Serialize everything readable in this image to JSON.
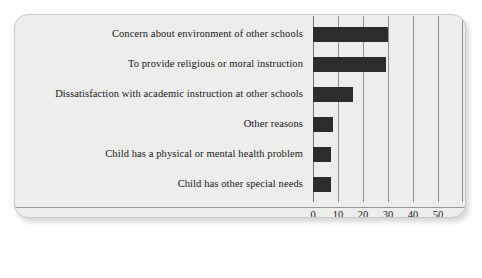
{
  "chart_data": {
    "type": "bar",
    "orientation": "horizontal",
    "title": "",
    "xlabel": "Percentage",
    "ylabel": "",
    "xlim": [
      0,
      55
    ],
    "xticks": [
      0,
      10,
      20,
      30,
      40,
      50
    ],
    "grid": true,
    "legend": false,
    "bar_color": "#2c2c2c",
    "categories": [
      "Concern about environment of other schools",
      "To provide religious or moral instruction",
      "Dissatisfaction with academic instruction at other schools",
      "Other reasons",
      "Child has a physical or mental health problem",
      "Child has other special needs"
    ],
    "values": [
      30,
      29,
      16,
      8,
      7,
      7
    ]
  },
  "chart": {
    "xlabel": "Percentage",
    "ticks": [
      "0",
      "10",
      "20",
      "30",
      "40",
      "50"
    ],
    "bars": [
      {
        "label": "Concern about environment of other schools",
        "value": 30
      },
      {
        "label": "To provide religious or moral instruction",
        "value": 29
      },
      {
        "label": "Dissatisfaction with academic instruction at other schools",
        "value": 16
      },
      {
        "label": "Other reasons",
        "value": 8
      },
      {
        "label": "Child has a physical or mental health problem",
        "value": 7
      },
      {
        "label": "Child has other special needs",
        "value": 7
      }
    ]
  },
  "style": {
    "card_background": "#ededeb",
    "bar_color": "#2c2c2c",
    "gridline_color": "#8e8e8e",
    "text_color": "#17171a"
  }
}
